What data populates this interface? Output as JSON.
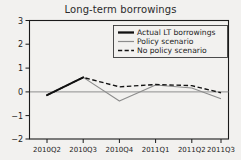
{
  "chart_data": {
    "type": "line",
    "title": "Long-term borrowings",
    "xlabel": "",
    "ylabel": "",
    "grid": false,
    "legend_position": "top-right",
    "categories": [
      "2010Q2",
      "2010Q3",
      "2010Q4",
      "2011Q1",
      "2011Q2",
      "2011Q3"
    ],
    "x_tick_labels": [
      "2010Q2",
      "2010Q3",
      "2010Q4",
      "2011Q1",
      "2011Q2",
      "2011Q3"
    ],
    "y_tick_labels": [
      "3",
      "2",
      "1",
      "0",
      "−1",
      "−2"
    ],
    "y_ticks": [
      3,
      2,
      1,
      0,
      -1,
      -2
    ],
    "ylim": [
      -2,
      3
    ],
    "zero_line": 0,
    "series": [
      {
        "name": "Actual LT borrowings",
        "style": "solid-thick-black",
        "color": "#111111",
        "x": [
          "2010Q2",
          "2010Q3"
        ],
        "values": [
          -0.15,
          0.6
        ]
      },
      {
        "name": "Policy scenario",
        "style": "solid-thin-gray",
        "color": "#8c8c8c",
        "x": [
          "2010Q2",
          "2010Q3",
          "2010Q4",
          "2011Q1",
          "2011Q2",
          "2011Q3"
        ],
        "values": [
          -0.15,
          0.6,
          -0.4,
          0.28,
          0.15,
          -0.3
        ]
      },
      {
        "name": "No policy scenario",
        "style": "dashed-black",
        "color": "#121212",
        "x": [
          "2010Q2",
          "2010Q3",
          "2010Q4",
          "2011Q1",
          "2011Q2",
          "2011Q3"
        ],
        "values": [
          -0.15,
          0.6,
          0.2,
          0.3,
          0.25,
          -0.05
        ]
      }
    ]
  },
  "legend": {
    "entries": [
      {
        "label": "Actual LT borrowings"
      },
      {
        "label": "Policy scenario"
      },
      {
        "label": "No policy scenario"
      }
    ]
  }
}
